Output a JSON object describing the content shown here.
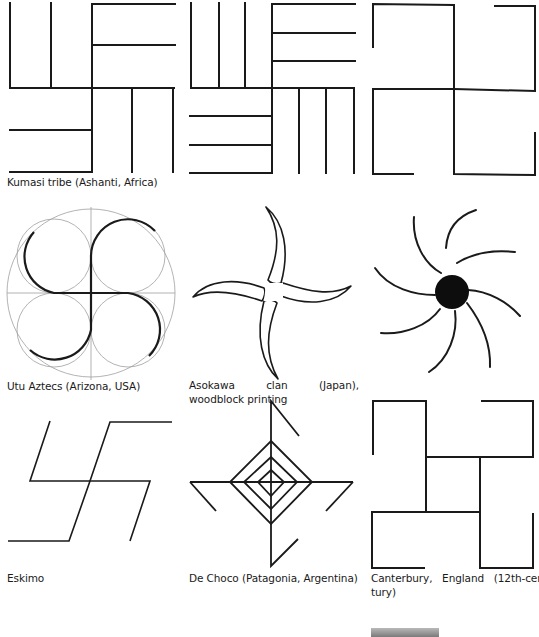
{
  "page": {
    "type": "swastika motif illustration plate",
    "stroke_color": "#1a1a1a",
    "guide_color": "#9a9a9a",
    "background": "#ffffff"
  },
  "figures": [
    {
      "id": "kumasi",
      "caption": "Kumasi tribe (Ashanti, Africa)",
      "shape": "rectilinear-meander-swastika-single-lines"
    },
    {
      "id": "kumasi-variant",
      "caption": "",
      "shape": "rectilinear-meander-swastika-triple-lines"
    },
    {
      "id": "hooked-cross",
      "caption": "",
      "shape": "rectilinear-swastika-hooked"
    },
    {
      "id": "utu-aztecs",
      "caption": "Utu Aztecs (Arizona, USA)",
      "shape": "curvilinear-swastika-with-guide-circles"
    },
    {
      "id": "asokawa",
      "caption": "Asokawa clan (Japan), woodblock printing",
      "shape": "curved-four-arm-crescent-swastika"
    },
    {
      "id": "black-sun",
      "caption": "",
      "shape": "eight-arm-curved-sun-wheel"
    },
    {
      "id": "eskimo",
      "caption": "Eskimo",
      "shape": "slanted-swastika"
    },
    {
      "id": "de-choco",
      "caption": "De Choco (Patagonia, Argentina)",
      "shape": "concentric-diamond-swastika"
    },
    {
      "id": "canterbury",
      "caption": "Canterbury, England (12th-century)",
      "caption_line1": "Canterbury,   England   (12th-cen-",
      "caption_line2": "tury)",
      "shape": "interlocked-rectilinear-swastika"
    }
  ]
}
